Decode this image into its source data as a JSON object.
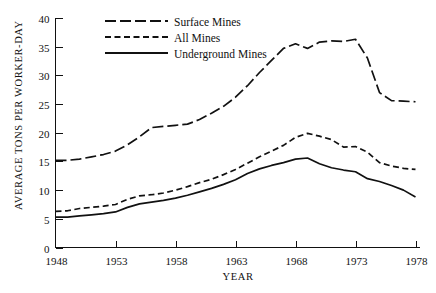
{
  "chart_data": {
    "type": "line",
    "title": "",
    "xlabel": "YEAR",
    "ylabel": "AVERAGE TONS PER WORKER-DAY",
    "xlim": [
      1948,
      1978
    ],
    "ylim": [
      0,
      40
    ],
    "xticks": [
      1948,
      1953,
      1958,
      1963,
      1968,
      1973,
      1978
    ],
    "xtick_labels": [
      "1948",
      "1953",
      "1958",
      "1963",
      "1968",
      "1973",
      "1978"
    ],
    "yticks": [
      0,
      5,
      10,
      15,
      20,
      25,
      30,
      35,
      40
    ],
    "ytick_labels": [
      "0",
      "5",
      "10",
      "15",
      "20",
      "25",
      "30",
      "35",
      "40"
    ],
    "grid": false,
    "legend_position": "top-center",
    "x": [
      1948,
      1949,
      1950,
      1951,
      1952,
      1953,
      1954,
      1955,
      1956,
      1957,
      1958,
      1959,
      1960,
      1961,
      1962,
      1963,
      1964,
      1965,
      1966,
      1967,
      1968,
      1969,
      1970,
      1971,
      1972,
      1973,
      1974,
      1975,
      1976,
      1977,
      1978
    ],
    "series": [
      {
        "name": "Surface Mines",
        "style": "long-dash",
        "values": [
          15.2,
          15.2,
          15.4,
          15.8,
          16.2,
          16.8,
          17.9,
          19.3,
          20.9,
          21.1,
          21.3,
          21.5,
          22.3,
          23.4,
          24.6,
          26.2,
          28.2,
          30.5,
          32.6,
          34.7,
          35.5,
          34.7,
          35.8,
          36.0,
          35.9,
          36.3,
          33.0,
          27.0,
          25.6,
          25.5,
          25.4
        ]
      },
      {
        "name": "All Mines",
        "style": "short-dash",
        "values": [
          6.3,
          6.4,
          6.8,
          7.0,
          7.2,
          7.5,
          8.4,
          9.0,
          9.2,
          9.5,
          10.0,
          10.6,
          11.3,
          11.9,
          12.7,
          13.6,
          14.7,
          15.8,
          16.8,
          17.8,
          19.2,
          19.9,
          19.4,
          18.8,
          17.5,
          17.6,
          16.6,
          14.8,
          14.2,
          13.8,
          13.6
        ]
      },
      {
        "name": "Underground Mines",
        "style": "solid",
        "values": [
          5.3,
          5.3,
          5.5,
          5.7,
          5.9,
          6.2,
          7.0,
          7.6,
          7.9,
          8.2,
          8.6,
          9.1,
          9.7,
          10.3,
          11.0,
          11.8,
          12.9,
          13.7,
          14.3,
          14.8,
          15.4,
          15.6,
          14.6,
          13.9,
          13.5,
          13.2,
          12.0,
          11.5,
          10.8,
          10.0,
          8.8
        ]
      }
    ]
  },
  "legend": {
    "items": [
      {
        "label": "Surface Mines",
        "style": "long-dash"
      },
      {
        "label": "All Mines",
        "style": "short-dash"
      },
      {
        "label": "Underground Mines",
        "style": "solid"
      }
    ]
  },
  "colors": {
    "ink": "#111111",
    "background": "#ffffff"
  }
}
